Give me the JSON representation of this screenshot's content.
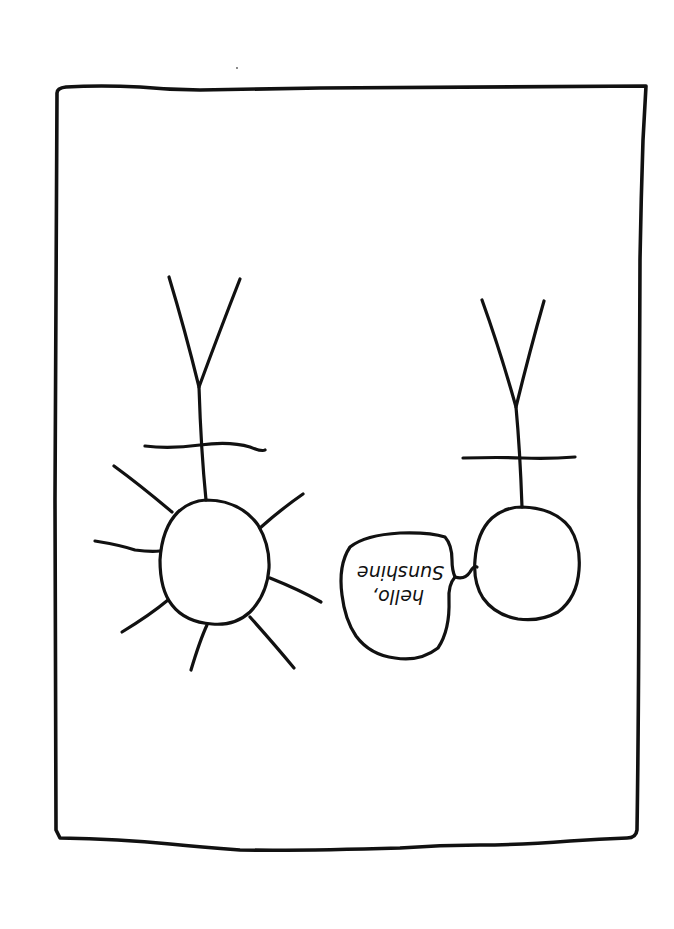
{
  "comic": {
    "description": "Hand-drawn single comic panel showing two upside-down stick figures; the left one is a sun with rays, the right one speaks.",
    "speech_bubble": {
      "line1": "hello,",
      "line2": "Sunshine",
      "orientation": "upside-down (rotated 180deg)"
    },
    "colors": {
      "ink": "#111111",
      "background": "#ffffff"
    }
  }
}
